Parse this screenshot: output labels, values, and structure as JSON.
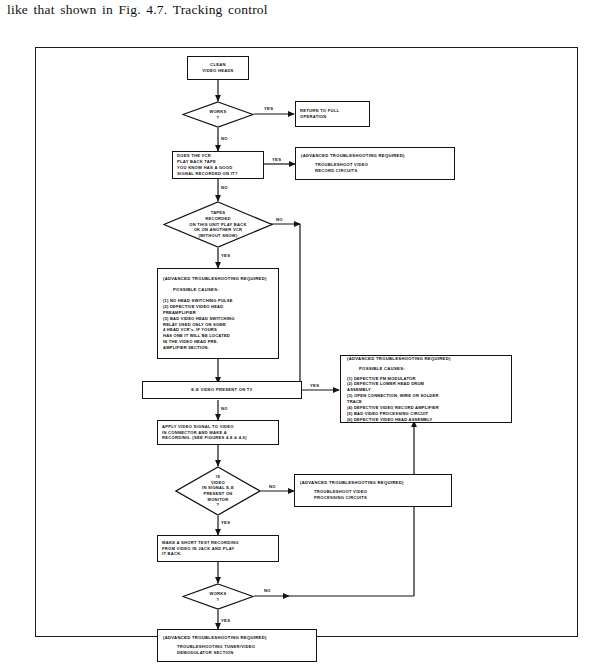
{
  "caption": {
    "text": "like that shown in Fig. 4.7. Tracking control"
  },
  "figure": {
    "frame_color": "#1a1a1a",
    "background": "#ffffff"
  },
  "flowchart": {
    "title": "VCR video playback troubleshooting flowchart",
    "nodes": [
      {
        "id": "clean-video-heads",
        "type": "process",
        "text": "CLEAN\nVIDEO HEADS"
      },
      {
        "id": "works-1",
        "type": "decision",
        "text": "WORKS\n?"
      },
      {
        "id": "return-to-full-operation",
        "type": "process",
        "text": "RETURN TO FULL\nOPERATION"
      },
      {
        "id": "does-vcr-play-back-tape",
        "type": "process",
        "text": "DOES THE VCR\nPLAY BACK TAPE\nYOU KNOW HAS A GOOD\nSIGNAL RECORDED ON IT?"
      },
      {
        "id": "troubleshoot-video-record-circuits",
        "type": "advanced",
        "header": "(ADVANCED TROUBLESHOOTING REQUIRED)",
        "body": "TROUBLESHOOT VIDEO\nRECORD CIRCUITS"
      },
      {
        "id": "tapes-play-back-ok-another-vcr",
        "type": "decision",
        "text": "TAPES\nRECORDED\nON THIS UNIT PLAY BACK\nOK ON ANOTHER VCR\n(WITHOUT SNOW)"
      },
      {
        "id": "advanced-head-switching-causes",
        "type": "advanced",
        "header": "(ADVANCED TROUBLESHOOTING REQUIRED)",
        "subheader": "POSSIBLE CAUSES:",
        "causes": "(1)  NO HEAD SWITCHING PULSE\n(2)  DEFECTIVE VIDEO HEAD\n      PREAMPLIFIER\n(3)  BAD VIDEO HEAD SWITCHING\n      RELAY USED ONLY ON SOME\n      4 HEAD VCR's. IF YOURS\n      HAS ONE IT WILL BE LOCATED\n      IN THE VIDEO HEAD PRE-\n      AMPLIFIER SECTION."
      },
      {
        "id": "ee-video-present-on-tv",
        "type": "process",
        "text": "E-E VIDEO PRESENT ON TV"
      },
      {
        "id": "advanced-fm-modulator-causes",
        "type": "advanced",
        "header": "(ADVANCED TROUBLESHOOTING REQUIRED)",
        "subheader": "POSSIBLE CAUSES:",
        "causes": "(1)  DEFECTIVE FM MODULATOR\n(2)  DEFECTIVE LOWER HEAD DRUM\n      ASSEMBLY\n(3)  OPEN CONNECTION, WIRE OR SOLDER\n      TRACE\n(4)  DEFECTIVE VIDEO RECORD  AMPLIFIER\n(5)  BAD VIDEO PROCESSING CIRCUIT\n(6)  DEFECTIVE VIDEO HEAD ASSEMBLY"
      },
      {
        "id": "apply-video-signal",
        "type": "process",
        "text": "APPLY VIDEO SIGNAL TO VIDEO\nIN CONNECTOR AND MAKE A\nRECORDING. (SEE FIGURES 4.8 & 4.9)"
      },
      {
        "id": "is-video-in-signal-present",
        "type": "decision",
        "text": "IS\nVIDEO\nIN SIGNAL E-E\nPRESENT ON\nMONITOR\n?"
      },
      {
        "id": "troubleshoot-video-processing-circuits",
        "type": "advanced",
        "header": "(ADVANCED TROUBLESHOOTING REQUIRED)",
        "body": "TROUBLESHOOT VIDEO\nPROCESSING CIRCUITS"
      },
      {
        "id": "make-short-test-recording",
        "type": "process",
        "text": "MAKE A SHORT TEST RECORDING\nFROM VIDEO IN JACK AND PLAY\nIT BACK."
      },
      {
        "id": "works-2",
        "type": "decision",
        "text": "WORKS\n?"
      },
      {
        "id": "troubleshoot-tuner-video-demodulator",
        "type": "advanced",
        "header": "(ADVANCED TROUBLESHOOTING REQUIRED)",
        "body": "TROUBLESHOOTING TUNER/VIDEO\nDEMODULATOR SECTION"
      }
    ],
    "edge_labels": {
      "works1_yes": "YES",
      "works1_no": "NO",
      "playback_yes": "YES",
      "playback_no": "NO",
      "tapes_no": "NO",
      "tapes_yes": "YES",
      "ee_yes": "YES",
      "ee_no": "NO",
      "videoin_no": "NO",
      "videoin_yes": "YES",
      "works2_no": "NO",
      "works2_yes": "YES"
    }
  }
}
